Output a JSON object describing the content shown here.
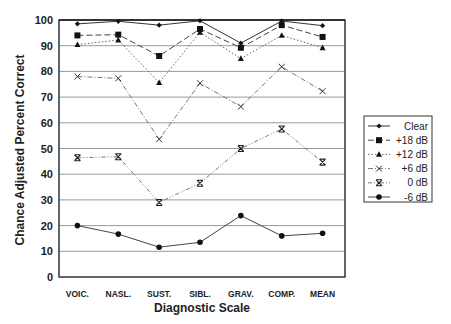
{
  "chart_data": {
    "type": "line",
    "title": "",
    "xlabel": "Diagnostic Scale",
    "ylabel": "Chance Adjusted Percent Correct",
    "ylim": [
      0,
      100
    ],
    "yticks": [
      0,
      10,
      20,
      30,
      40,
      50,
      60,
      70,
      80,
      90,
      100
    ],
    "grid": "horizontal",
    "legend_position": "right",
    "categories": [
      "VOIC.",
      "NASL.",
      "SUST.",
      "SIBL.",
      "GRAV.",
      "COMP.",
      "MEAN"
    ],
    "series": [
      {
        "name": "Clear",
        "marker": "diamond",
        "dash": "",
        "values": [
          98.5,
          99.5,
          98,
          99.7,
          91,
          99.6,
          97.8
        ]
      },
      {
        "name": "+18 dB",
        "marker": "square",
        "dash": "6,3",
        "values": [
          94,
          94.3,
          86,
          96.5,
          89.2,
          98,
          93.4
        ]
      },
      {
        "name": "+12 dB",
        "marker": "triangle",
        "dash": "1.5,2",
        "values": [
          90.4,
          92.2,
          75.6,
          95.2,
          85,
          94,
          89.2
        ]
      },
      {
        "name": "+6 dB",
        "marker": "x",
        "dash": "5,2,1,2",
        "values": [
          78,
          77.3,
          53.6,
          75.4,
          66.3,
          81.8,
          72.3
        ]
      },
      {
        "name": "0 dB",
        "marker": "xbar",
        "dash": "4,2,1,2,1,2",
        "values": [
          46.4,
          46.8,
          29,
          36.5,
          50,
          57.6,
          44.7
        ]
      },
      {
        "name": "-6 dB",
        "marker": "circle",
        "dash": "",
        "values": [
          20,
          16.7,
          11.6,
          13.5,
          23.9,
          16,
          17
        ]
      }
    ]
  }
}
